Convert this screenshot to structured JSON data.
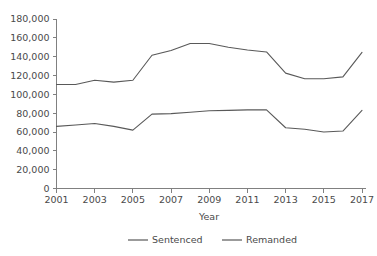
{
  "chart_data": {
    "type": "line",
    "title": "",
    "xlabel": "Year",
    "ylabel": "",
    "x": [
      2001,
      2002,
      2003,
      2004,
      2005,
      2006,
      2007,
      2008,
      2009,
      2010,
      2011,
      2012,
      2013,
      2014,
      2015,
      2016,
      2017
    ],
    "xlim": [
      2001,
      2017
    ],
    "ylim": [
      0,
      180000
    ],
    "grid": false,
    "legend_position": "bottom",
    "x_tick_labels": [
      "2001",
      "2003",
      "2005",
      "2007",
      "2009",
      "2011",
      "2013",
      "2015",
      "2017"
    ],
    "x_tick_values": [
      2001,
      2003,
      2005,
      2007,
      2009,
      2011,
      2013,
      2015,
      2017
    ],
    "y_tick_labels": [
      "0",
      "20,000",
      "40,000",
      "60,000",
      "80,000",
      "100,000",
      "120,000",
      "140,000",
      "160,000",
      "180,000"
    ],
    "y_tick_values": [
      0,
      20000,
      40000,
      60000,
      80000,
      100000,
      120000,
      140000,
      160000,
      180000
    ],
    "series": [
      {
        "name": "Sentenced",
        "color": "#595959",
        "values": [
          66000,
          67500,
          69000,
          66000,
          62000,
          79000,
          79500,
          81000,
          82500,
          83000,
          83500,
          83500,
          64500,
          63000,
          60000,
          61000,
          83000
        ]
      },
      {
        "name": "Remanded",
        "color": "#595959",
        "values": [
          110500,
          110500,
          115000,
          113000,
          115000,
          141500,
          146500,
          154000,
          154000,
          150000,
          147000,
          145000,
          122500,
          116500,
          116500,
          118500,
          144500
        ]
      }
    ]
  },
  "legend": {
    "items": [
      {
        "label": "Sentenced"
      },
      {
        "label": "Remanded"
      }
    ]
  },
  "axes": {
    "x_title": "Year"
  }
}
